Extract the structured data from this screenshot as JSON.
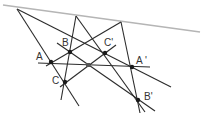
{
  "diagram": {
    "colors": {
      "axis_line": "#b5b5b5",
      "line": "#2b2b2b",
      "point": "#1a1a1a",
      "center": "#555555",
      "label": "#333333"
    },
    "axis": {
      "x1": 3,
      "y1": 5,
      "x2": 200,
      "y2": 32
    },
    "apexes": [
      {
        "id": "P1",
        "x": 17,
        "y": 9
      },
      {
        "id": "P2",
        "x": 76,
        "y": 16
      },
      {
        "id": "P3",
        "x": 121,
        "y": 22
      }
    ],
    "points": [
      {
        "id": "A",
        "label": "A",
        "x": 51,
        "y": 62,
        "lx": 36,
        "ly": 60
      },
      {
        "id": "B",
        "label": "B",
        "x": 70,
        "y": 52,
        "lx": 62,
        "ly": 46
      },
      {
        "id": "C",
        "label": "C",
        "x": 65,
        "y": 82,
        "lx": 52,
        "ly": 84
      },
      {
        "id": "A2",
        "label": "A '",
        "x": 132,
        "y": 67,
        "lx": 136,
        "ly": 64
      },
      {
        "id": "B2",
        "label": "B'",
        "x": 138,
        "y": 100,
        "lx": 144,
        "ly": 100
      },
      {
        "id": "C2",
        "label": "C'",
        "x": 105,
        "y": 53,
        "lx": 104,
        "ly": 46
      }
    ],
    "center": {
      "x": 88,
      "y": 65
    },
    "lines": [
      {
        "x1": 17,
        "y1": 9,
        "x2": 79,
        "y2": 106
      },
      {
        "x1": 17,
        "y1": 9,
        "x2": 171,
        "y2": 87
      },
      {
        "x1": 76,
        "y1": 16,
        "x2": 61,
        "y2": 100
      },
      {
        "x1": 76,
        "y1": 16,
        "x2": 145,
        "y2": 112
      },
      {
        "x1": 121,
        "y1": 22,
        "x2": 46,
        "y2": 66
      },
      {
        "x1": 121,
        "y1": 22,
        "x2": 140,
        "y2": 113
      },
      {
        "x1": 38,
        "y1": 63,
        "x2": 150,
        "y2": 67
      },
      {
        "x1": 57,
        "y1": 43,
        "x2": 155,
        "y2": 111
      },
      {
        "x1": 60,
        "y1": 87,
        "x2": 116,
        "y2": 45
      }
    ]
  }
}
